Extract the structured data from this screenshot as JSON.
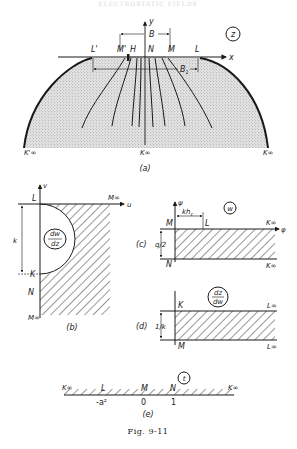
{
  "running_head": "ELECTROSTATIC FIELDS",
  "figure_caption": "Fig. 9-11",
  "panels": {
    "a": {
      "caption": "(a)",
      "plane_label": "z",
      "axes": {
        "x": "x",
        "y": "y"
      },
      "points": {
        "L_prime": "L'",
        "M_prime": "M'",
        "H": "H",
        "N": "N",
        "M": "M",
        "L": "L",
        "E": "E"
      },
      "dimensions": {
        "B": "B",
        "B1": "B1"
      },
      "infinity_labels": {
        "left": "K'∞",
        "center": "K∞",
        "right": "K∞"
      }
    },
    "b": {
      "caption": "(b)",
      "plane_label": "dw/dz",
      "plane_label_num": "dw",
      "plane_label_den": "dz",
      "axes": {
        "u": "u",
        "v": "v"
      },
      "points": {
        "L": "L",
        "K": "K",
        "N": "N"
      },
      "dimension": "k",
      "infinity_labels": {
        "top_right": "M∞",
        "bottom": "M∞"
      }
    },
    "c": {
      "caption": "(c)",
      "plane_label": "w",
      "axes": {
        "phi": "φ",
        "psi": "ψ"
      },
      "points": {
        "M": "M",
        "L": "L",
        "N": "N"
      },
      "dimensions": {
        "khc": "kh",
        "khc_sub": "c",
        "height": "q/2"
      },
      "infinity_labels": {
        "top": "K∞",
        "bottom": "K∞"
      }
    },
    "d": {
      "caption": "(d)",
      "plane_label_num": "dz",
      "plane_label_den": "dw",
      "points": {
        "K": "K",
        "M": "M"
      },
      "dimension": "1/k",
      "infinity_labels": {
        "top": "L∞",
        "bottom": "L∞"
      }
    },
    "e": {
      "caption": "(e)",
      "plane_label": "t",
      "points": {
        "L": "L",
        "M": "M",
        "N": "N"
      },
      "ticks": {
        "L": "-a²",
        "M": "0",
        "N": "1"
      },
      "infinity_labels": {
        "left": "K∞",
        "right": "K∞"
      }
    }
  },
  "colors": {
    "ink": "#1a1a1a",
    "stipple": "#9a9a9a",
    "paper": "#ffffff"
  }
}
